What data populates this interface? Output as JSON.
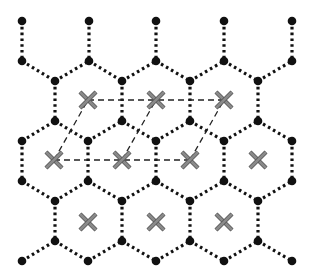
{
  "diagram": {
    "colors": {
      "background": "#ffffff",
      "bond": "#111111",
      "node": "#111111",
      "center_mark": "#8a8a8a",
      "center_mark_outline": "#555555",
      "cell_line": "#222222"
    },
    "bond_style": "dotted",
    "cell_line_style": "dashed",
    "nodes": [
      [
        22,
        21
      ],
      [
        89,
        21
      ],
      [
        156,
        21
      ],
      [
        224,
        21
      ],
      [
        292,
        21
      ],
      [
        22,
        61
      ],
      [
        89,
        61
      ],
      [
        156,
        61
      ],
      [
        224,
        61
      ],
      [
        292,
        61
      ],
      [
        55,
        81
      ],
      [
        122,
        81
      ],
      [
        190,
        81
      ],
      [
        258,
        81
      ],
      [
        55,
        121
      ],
      [
        122,
        121
      ],
      [
        190,
        121
      ],
      [
        258,
        121
      ],
      [
        22,
        141
      ],
      [
        88,
        141
      ],
      [
        156,
        141
      ],
      [
        224,
        141
      ],
      [
        292,
        141
      ],
      [
        22,
        181
      ],
      [
        88,
        181
      ],
      [
        156,
        181
      ],
      [
        224,
        181
      ],
      [
        292,
        181
      ],
      [
        55,
        201
      ],
      [
        122,
        201
      ],
      [
        190,
        201
      ],
      [
        258,
        201
      ],
      [
        55,
        241
      ],
      [
        122,
        241
      ],
      [
        190,
        241
      ],
      [
        258,
        241
      ],
      [
        22,
        261
      ],
      [
        88,
        261
      ],
      [
        156,
        261
      ],
      [
        224,
        261
      ],
      [
        292,
        261
      ]
    ],
    "bonds": [
      [
        [
          22,
          21
        ],
        [
          22,
          61
        ]
      ],
      [
        [
          89,
          21
        ],
        [
          89,
          61
        ]
      ],
      [
        [
          156,
          21
        ],
        [
          156,
          61
        ]
      ],
      [
        [
          224,
          21
        ],
        [
          224,
          61
        ]
      ],
      [
        [
          292,
          21
        ],
        [
          292,
          61
        ]
      ],
      [
        [
          22,
          61
        ],
        [
          55,
          81
        ]
      ],
      [
        [
          55,
          81
        ],
        [
          89,
          61
        ]
      ],
      [
        [
          89,
          61
        ],
        [
          122,
          81
        ]
      ],
      [
        [
          122,
          81
        ],
        [
          156,
          61
        ]
      ],
      [
        [
          156,
          61
        ],
        [
          190,
          81
        ]
      ],
      [
        [
          190,
          81
        ],
        [
          224,
          61
        ]
      ],
      [
        [
          224,
          61
        ],
        [
          258,
          81
        ]
      ],
      [
        [
          258,
          81
        ],
        [
          292,
          61
        ]
      ],
      [
        [
          55,
          81
        ],
        [
          55,
          121
        ]
      ],
      [
        [
          122,
          81
        ],
        [
          122,
          121
        ]
      ],
      [
        [
          190,
          81
        ],
        [
          190,
          121
        ]
      ],
      [
        [
          258,
          81
        ],
        [
          258,
          121
        ]
      ],
      [
        [
          22,
          141
        ],
        [
          55,
          121
        ]
      ],
      [
        [
          55,
          121
        ],
        [
          88,
          141
        ]
      ],
      [
        [
          88,
          141
        ],
        [
          122,
          121
        ]
      ],
      [
        [
          122,
          121
        ],
        [
          156,
          141
        ]
      ],
      [
        [
          156,
          141
        ],
        [
          190,
          121
        ]
      ],
      [
        [
          190,
          121
        ],
        [
          224,
          141
        ]
      ],
      [
        [
          224,
          141
        ],
        [
          258,
          121
        ]
      ],
      [
        [
          258,
          121
        ],
        [
          292,
          141
        ]
      ],
      [
        [
          22,
          141
        ],
        [
          22,
          181
        ]
      ],
      [
        [
          88,
          141
        ],
        [
          88,
          181
        ]
      ],
      [
        [
          156,
          141
        ],
        [
          156,
          181
        ]
      ],
      [
        [
          224,
          141
        ],
        [
          224,
          181
        ]
      ],
      [
        [
          292,
          141
        ],
        [
          292,
          181
        ]
      ],
      [
        [
          22,
          181
        ],
        [
          55,
          201
        ]
      ],
      [
        [
          55,
          201
        ],
        [
          88,
          181
        ]
      ],
      [
        [
          88,
          181
        ],
        [
          122,
          201
        ]
      ],
      [
        [
          122,
          201
        ],
        [
          156,
          181
        ]
      ],
      [
        [
          156,
          181
        ],
        [
          190,
          201
        ]
      ],
      [
        [
          190,
          201
        ],
        [
          224,
          181
        ]
      ],
      [
        [
          224,
          181
        ],
        [
          258,
          201
        ]
      ],
      [
        [
          258,
          201
        ],
        [
          292,
          181
        ]
      ],
      [
        [
          55,
          201
        ],
        [
          55,
          241
        ]
      ],
      [
        [
          122,
          201
        ],
        [
          122,
          241
        ]
      ],
      [
        [
          190,
          201
        ],
        [
          190,
          241
        ]
      ],
      [
        [
          258,
          201
        ],
        [
          258,
          241
        ]
      ],
      [
        [
          22,
          261
        ],
        [
          55,
          241
        ]
      ],
      [
        [
          55,
          241
        ],
        [
          88,
          261
        ]
      ],
      [
        [
          88,
          261
        ],
        [
          122,
          241
        ]
      ],
      [
        [
          122,
          241
        ],
        [
          156,
          261
        ]
      ],
      [
        [
          156,
          261
        ],
        [
          190,
          241
        ]
      ],
      [
        [
          190,
          241
        ],
        [
          224,
          261
        ]
      ],
      [
        [
          224,
          261
        ],
        [
          258,
          241
        ]
      ],
      [
        [
          258,
          241
        ],
        [
          292,
          261
        ]
      ]
    ],
    "centers": [
      [
        88,
        100
      ],
      [
        156,
        100
      ],
      [
        224,
        100
      ],
      [
        54,
        160
      ],
      [
        122,
        160
      ],
      [
        190,
        160
      ],
      [
        258,
        160
      ],
      [
        88,
        222
      ],
      [
        156,
        222
      ],
      [
        224,
        222
      ]
    ],
    "cell_lines": [
      [
        [
          88,
          100
        ],
        [
          224,
          100
        ]
      ],
      [
        [
          54,
          160
        ],
        [
          190,
          160
        ]
      ],
      [
        [
          54,
          160
        ],
        [
          88,
          100
        ]
      ],
      [
        [
          122,
          160
        ],
        [
          156,
          100
        ]
      ],
      [
        [
          190,
          160
        ],
        [
          224,
          100
        ]
      ]
    ]
  }
}
